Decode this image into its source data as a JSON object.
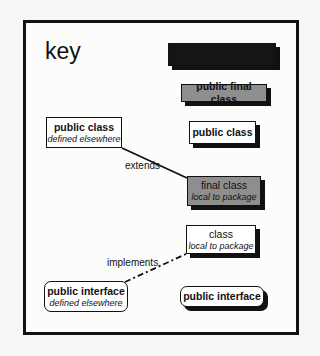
{
  "key": {
    "title": "key",
    "boxes": {
      "abstract_black": {
        "label": ""
      },
      "public_final_class": {
        "label": "public final class"
      },
      "public_class": {
        "label": "public class"
      },
      "public_class_elsewhere": {
        "label": "public class",
        "sub": "defined elsewhere"
      },
      "final_class": {
        "label": "final class",
        "sub": "local to package"
      },
      "class_local": {
        "label": "class",
        "sub": "local to package"
      },
      "public_interface_elsewhere": {
        "label": "public interface",
        "sub": "defined elsewhere"
      },
      "public_interface": {
        "label": "public interface"
      }
    },
    "relations": {
      "extends": "extends",
      "implements": "implements."
    }
  },
  "colors": {
    "final_fill": "#8e8e8e",
    "black_fill": "#151515",
    "border": "#111111"
  }
}
